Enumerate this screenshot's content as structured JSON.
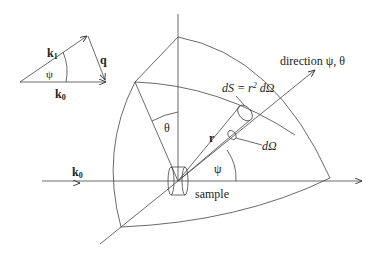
{
  "triangle": {
    "k1": "k",
    "k1_sub": "1",
    "k0": "k",
    "k0_sub": "0",
    "q": "q",
    "psi": "ψ"
  },
  "main": {
    "direction": "direction ψ, θ",
    "dS_left": "dS = r",
    "dS_sup": "2",
    "dS_right": " dΩ",
    "theta": "θ",
    "r": "r",
    "dOmega": "dΩ",
    "psi": "ψ",
    "k0": "k",
    "k0_sub": "0",
    "sample": "sample"
  }
}
